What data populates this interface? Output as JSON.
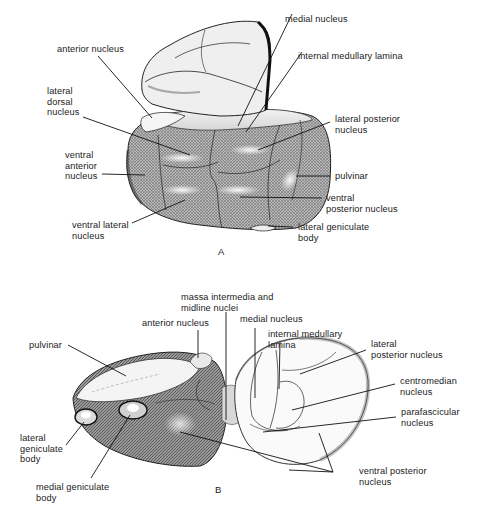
{
  "figure": {
    "panels": [
      {
        "id": "A",
        "letter": "A",
        "labels": {
          "anterior_nucleus": "anterior nucleus",
          "medial_nucleus": "medial nucleus",
          "internal_medullary_lamina": "internal medullary lamina",
          "lateral_dorsal_nucleus": "lateral\ndorsal\nnucleus",
          "lateral_posterior_nucleus": "lateral posterior\nnucleus",
          "ventral_anterior_nucleus": "ventral\nanterior\nnucleus",
          "pulvinar": "pulvinar",
          "ventral_posterior_nucleus": "ventral\nposterior nucleus",
          "ventral_lateral_nucleus": "ventral lateral\nnucleus",
          "lateral_geniculate_body": "lateral geniculate\nbody"
        }
      },
      {
        "id": "B",
        "letter": "B",
        "labels": {
          "massa_intermedia": "massa intermedia and\nmidline nuclei",
          "anterior_nucleus": "anterior nucleus",
          "medial_nucleus": "medial nucleus",
          "internal_medullary_lamina": "internal medullary\nlamina",
          "pulvinar": "pulvinar",
          "lateral_posterior_nucleus": "lateral\nposterior nucleus",
          "centromedian_nucleus": "centromedian\nnucleus",
          "parafascicular_nucleus": "parafascicular\nnucleus",
          "lateral_geniculate_body": "lateral\ngeniculate\nbody",
          "medial_geniculate_body": "medial geniculate\nbody",
          "ventral_posterior_nucleus": "ventral posterior\nnucleus"
        }
      }
    ],
    "colors": {
      "ink": "#1a1a1a",
      "shade_dark": "#7a7a7a",
      "shade_mid": "#a8a8a8",
      "paper": "#ffffff"
    }
  }
}
